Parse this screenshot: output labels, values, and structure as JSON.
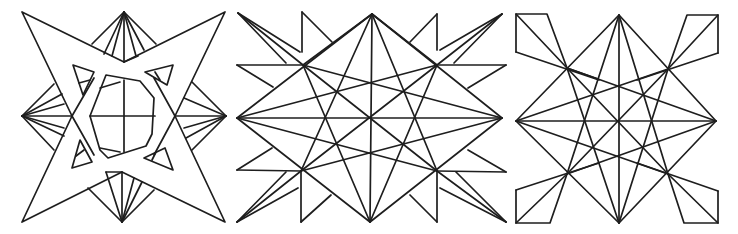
{
  "figure": {
    "panels": [
      {
        "id": "panel-1",
        "label": "four-point star with octagon and fan rays"
      },
      {
        "id": "panel-2",
        "label": "radiating star lattice with spikes"
      },
      {
        "id": "panel-3",
        "label": "star lattice with corner kite shapes"
      }
    ],
    "colors": {
      "stroke": "#1e1e1e",
      "background": "#ffffff"
    }
  }
}
